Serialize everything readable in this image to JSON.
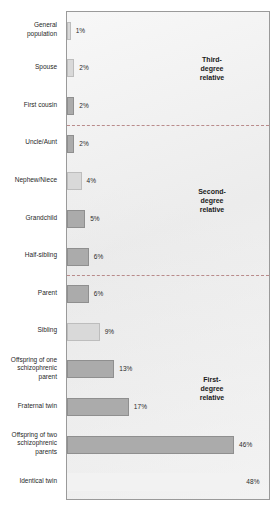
{
  "chart_data": {
    "type": "bar",
    "orientation": "horizontal",
    "title": "",
    "subtitle": "",
    "xlabel": "",
    "ylabel": "",
    "xlim": [
      0,
      56
    ],
    "grid": false,
    "legend": null,
    "value_suffix": "%",
    "categories": [
      "General\npopulation",
      "Spouse",
      "First cousin",
      "Uncle/Aunt",
      "Nephew/Niece",
      "Grandchild",
      "Half-sibling",
      "Parent",
      "Sibling",
      "Offspring of one\nschizophrenic\nparent",
      "Fraternal twin",
      "Offspring of two\nschizophrenic\nparents",
      "Identical twin"
    ],
    "values": [
      1,
      2,
      2,
      2,
      4,
      5,
      6,
      6,
      9,
      13,
      17,
      46,
      48
    ],
    "value_labels": [
      "1%",
      "2%",
      "2%",
      "2%",
      "4%",
      "5%",
      "6%",
      "6%",
      "9%",
      "13%",
      "17%",
      "46%",
      "48%"
    ],
    "bar_shades": [
      "light",
      "light",
      "mid",
      "mid",
      "light",
      "mid",
      "mid",
      "mid",
      "light",
      "mid",
      "mid",
      "mid",
      "blank"
    ],
    "groups": [
      {
        "label": "Third-\ndegree\nrelative",
        "categories": [
          "General population",
          "Spouse",
          "First cousin"
        ]
      },
      {
        "label": "Second-\ndegree\nrelative",
        "categories": [
          "Uncle/Aunt",
          "Nephew/Niece",
          "Grandchild",
          "Half-sibling"
        ]
      },
      {
        "label": "First-\ndegree\nrelative",
        "categories": [
          "Parent",
          "Sibling",
          "Offspring of one schizophrenic parent",
          "Fraternal twin",
          "Offspring of two schizophrenic parents",
          "Identical twin"
        ]
      }
    ],
    "group_dividers_after": [
      "First cousin",
      "Half-sibling"
    ],
    "colors": {
      "plot_background": "#eeeeee",
      "plot_border": "#9a9a9a",
      "bar_light": "#d9d9d9",
      "bar_mid": "#ababab",
      "bar_border": "#8d8d8d",
      "divider": "#b07a7a",
      "label_text": "#1f1f1f"
    }
  }
}
